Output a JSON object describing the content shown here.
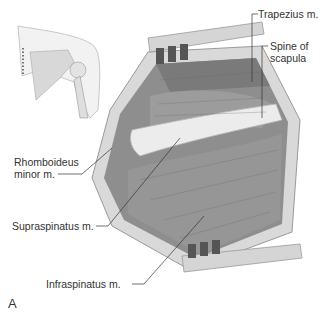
{
  "figure": {
    "panel_letter": "A",
    "inset": {
      "description": "posterior shoulder with dotted incision line"
    },
    "labels": [
      {
        "id": "trapezius",
        "text": "Trapezius m."
      },
      {
        "id": "spine1",
        "text": "Spine of"
      },
      {
        "id": "spine2",
        "text": "scapula"
      },
      {
        "id": "rhomb1",
        "text": "Rhomboideus"
      },
      {
        "id": "rhomb2",
        "text": "minor m."
      },
      {
        "id": "supra",
        "text": "Supraspinatus m."
      },
      {
        "id": "infra",
        "text": "Infraspinatus m."
      }
    ],
    "colors": {
      "line": "#333333",
      "muscle": "#8a8a8a",
      "bone": "#e6e6e6",
      "skin": "#d4d4d4",
      "retractor": "#cfcfcf"
    }
  }
}
